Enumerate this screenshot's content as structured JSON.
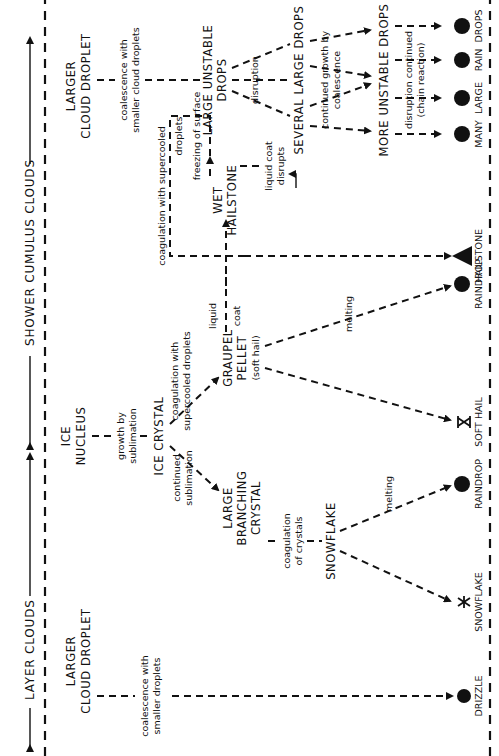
{
  "header": {
    "layer_clouds": "LAYER CLOUDS",
    "shower_cumulus_clouds": "SHOWER CUMULUS CLOUDS"
  },
  "layer": {
    "droplet_line1": "LARGER",
    "droplet_line2": "CLOUD DROPLET",
    "coalescence_line1": "coalescence with",
    "coalescence_line2": "smaller droplets",
    "drizzle": "DRIZZLE"
  },
  "ice": {
    "nucleus_line1": "ICE",
    "nucleus_line2": "NUCLEUS",
    "growth_line1": "growth by",
    "growth_line2": "sublimation",
    "crystal": "ICE CRYSTAL",
    "continued_line1": "continued",
    "continued_line2": "sublimation",
    "branching_line1": "LARGE",
    "branching_line2": "BRANCHING",
    "branching_line3": "CRYSTAL",
    "coag_crystals_line1": "coagulation",
    "coag_crystals_line2": "of crystals",
    "snowflake": "SNOWFLAKE",
    "melting": "melting",
    "out_snowflake": "SNOWFLAKE",
    "out_raindrop": "RAINDROP",
    "coag_super_line1": "coagulation with",
    "coag_super_line2": "supercooled droplets",
    "graupel_line1": "GRAUPEL",
    "graupel_line2": "PELLET",
    "graupel_line3": "(soft hail)",
    "graupel_melting": "melting",
    "out_soft_hail": "SOFT HAIL",
    "out_raindrop2": "RAINDROP",
    "liquid_coat_line1": "liquid",
    "liquid_coat_line2": "coat",
    "wet_line1": "WET",
    "wet_line2": "HAILSTONE",
    "coag_loop_line1": "coagulation with supercooled",
    "coag_loop_line2": "droplets",
    "freezing": "freezing of surface",
    "coat_disrupts_line1": "liquid coat",
    "coat_disrupts_line2": "disrupts",
    "out_hailstone": "HAILSTONE"
  },
  "shower": {
    "droplet_line1": "LARGER",
    "droplet_line2": "CLOUD DROPLET",
    "coalescence_line1": "coalescence with",
    "coalescence_line2": "smaller cloud droplets",
    "unstable_line1": "LARGE UNSTABLE",
    "unstable_line2": "DROPS",
    "disruption": "disruption",
    "several": "SEVERAL LARGE DROPS",
    "continued_line1": "continued growth by",
    "continued_line2": "coalescence",
    "more_unstable": "MORE UNSTABLE DROPS",
    "chain_line1": "disruption continued",
    "chain_line2": "(chain reaction)",
    "out_many": "MANY",
    "out_large": "LARGE",
    "out_rain": "RAIN",
    "out_drops": "DROPS"
  }
}
